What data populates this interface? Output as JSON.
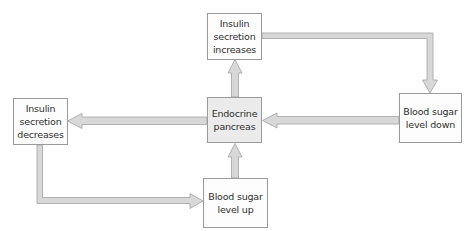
{
  "diagram": {
    "type": "feedback-loop",
    "colors": {
      "box_border": "#9a9a9a",
      "box_fill": "#fdfdfd",
      "center_fill": "#ebebeb",
      "arrow_fill": "#d8d8d8",
      "arrow_stroke": "#a2a2a2",
      "text": "#2e2e2e"
    },
    "nodes": {
      "center": {
        "label": "Endocrine\npancreas"
      },
      "top": {
        "label": "Insulin\nsecretion\nincreases"
      },
      "right": {
        "label": "Blood sugar\nlevel down"
      },
      "left": {
        "label": "Insulin\nsecretion\ndecreases"
      },
      "bottom": {
        "label": "Blood sugar\nlevel up"
      }
    },
    "edges": [
      {
        "from": "center",
        "to": "top"
      },
      {
        "from": "top",
        "to": "right"
      },
      {
        "from": "right",
        "to": "center"
      },
      {
        "from": "center",
        "to": "left"
      },
      {
        "from": "left",
        "to": "bottom"
      },
      {
        "from": "bottom",
        "to": "center"
      }
    ]
  }
}
